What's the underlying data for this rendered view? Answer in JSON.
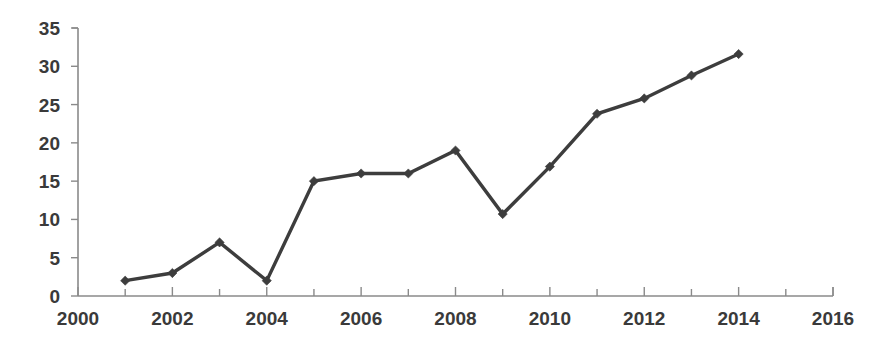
{
  "chart_data": {
    "type": "line",
    "title": "",
    "subtitle": "",
    "xlabel": "",
    "ylabel": "",
    "x": [
      2001,
      2002,
      2003,
      2004,
      2005,
      2006,
      2007,
      2008,
      2009,
      2010,
      2011,
      2012,
      2013,
      2014
    ],
    "values": [
      2.0,
      3.0,
      7.0,
      2.0,
      15.0,
      16.0,
      16.0,
      19.0,
      10.7,
      16.9,
      23.8,
      25.8,
      28.8,
      31.6
    ],
    "series": [
      {
        "name": "",
        "values": [
          2.0,
          3.0,
          7.0,
          2.0,
          15.0,
          16.0,
          16.0,
          19.0,
          10.7,
          16.9,
          23.8,
          25.8,
          28.8,
          31.6
        ]
      }
    ],
    "xlim": [
      2000,
      2016
    ],
    "ylim": [
      0,
      35
    ],
    "x_ticks": [
      2000,
      2002,
      2004,
      2006,
      2008,
      2010,
      2012,
      2014,
      2016
    ],
    "x_tick_labels": [
      "2000",
      "2002",
      "2004",
      "2006",
      "2008",
      "2010",
      "2012",
      "2014",
      "2016"
    ],
    "x_minor_ticks": [
      2001,
      2003,
      2005,
      2007,
      2009,
      2011,
      2013,
      2015
    ],
    "y_ticks": [
      0,
      5,
      10,
      15,
      20,
      25,
      30,
      35
    ],
    "y_tick_labels": [
      "0",
      "5",
      "10",
      "15",
      "20",
      "25",
      "30",
      "35"
    ],
    "grid": false,
    "legend": null,
    "legend_position": "none",
    "annotations": [],
    "marker": "diamond",
    "colors": {
      "line": "#3d3d3d",
      "marker": "#3d3d3d",
      "axis": "#8a8a8a",
      "tick_text": "#3a3a3a",
      "background": "#ffffff"
    }
  }
}
